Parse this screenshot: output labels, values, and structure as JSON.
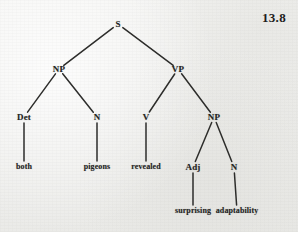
{
  "figure": {
    "number": "13.8",
    "sentence": "both pigeons revealed surprising adaptability"
  },
  "colors": {
    "paper": "#f1f1ef",
    "ink": "#242423",
    "branch": "#2d2d2b"
  },
  "tree": {
    "nodes": {
      "s": {
        "label": "S",
        "x": 118,
        "y": 24,
        "kind": "category"
      },
      "np_subject": {
        "label": "NP",
        "x": 59,
        "y": 69,
        "kind": "category"
      },
      "vp": {
        "label": "VP",
        "x": 178,
        "y": 69,
        "kind": "category"
      },
      "det": {
        "label": "Det",
        "x": 24,
        "y": 117,
        "kind": "category"
      },
      "n_subject": {
        "label": "N",
        "x": 97,
        "y": 117,
        "kind": "category"
      },
      "v": {
        "label": "V",
        "x": 146,
        "y": 117,
        "kind": "category"
      },
      "np_object": {
        "label": "NP",
        "x": 214,
        "y": 117,
        "kind": "category"
      },
      "adj": {
        "label": "Adj",
        "x": 193,
        "y": 167,
        "kind": "category"
      },
      "n_object": {
        "label": "N",
        "x": 234,
        "y": 167,
        "kind": "category"
      },
      "word_both": {
        "label": "both",
        "x": 24,
        "y": 167,
        "kind": "word"
      },
      "word_pigeons": {
        "label": "pigeons",
        "x": 97,
        "y": 167,
        "kind": "word"
      },
      "word_revealed": {
        "label": "revealed",
        "x": 146,
        "y": 167,
        "kind": "word"
      },
      "word_surprising": {
        "label": "surprising",
        "x": 193,
        "y": 211,
        "kind": "word"
      },
      "word_adaptability": {
        "label": "adaptability",
        "x": 237,
        "y": 211,
        "kind": "word"
      }
    },
    "edges": [
      {
        "from": "s",
        "to": "np_subject"
      },
      {
        "from": "s",
        "to": "vp"
      },
      {
        "from": "np_subject",
        "to": "det"
      },
      {
        "from": "np_subject",
        "to": "n_subject"
      },
      {
        "from": "vp",
        "to": "v"
      },
      {
        "from": "vp",
        "to": "np_object"
      },
      {
        "from": "det",
        "to": "word_both"
      },
      {
        "from": "n_subject",
        "to": "word_pigeons"
      },
      {
        "from": "v",
        "to": "word_revealed"
      },
      {
        "from": "np_object",
        "to": "adj"
      },
      {
        "from": "np_object",
        "to": "n_object"
      },
      {
        "from": "adj",
        "to": "word_surprising"
      },
      {
        "from": "n_object",
        "to": "word_adaptability"
      }
    ]
  },
  "figure_label": {
    "x": 262,
    "y": 11
  }
}
